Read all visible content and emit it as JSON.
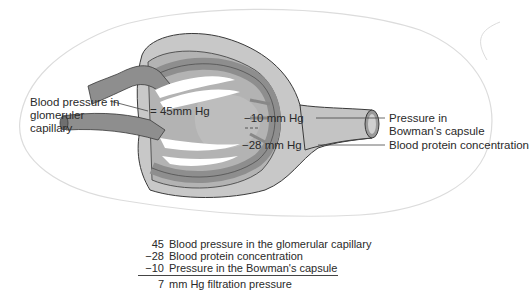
{
  "diagram": {
    "labels": {
      "glomerular_bp": [
        "Blood pressure in",
        "glomeruler",
        "capillary"
      ],
      "glomerular_value": "= 45mm Hg",
      "capsule_value": "−10 mm Hg",
      "capsule_label": [
        "Pressure in",
        "Bowman's capsule"
      ],
      "protein_value": "−28 mm Hg",
      "protein_label": "Blood protein concentration"
    },
    "summary": [
      {
        "value": "45",
        "text": "Blood pressure in the glomerular capillary"
      },
      {
        "value": "−28",
        "text": "Blood protein concentration"
      },
      {
        "value": "−10",
        "text": "Pressure in the Bowman's capsule"
      }
    ],
    "result": {
      "value": "7",
      "text": "mm Hg filtration pressure"
    },
    "colors": {
      "capsule": "#c8c8c8",
      "vessel": "#8e8e8e",
      "inner": "#bdbdbd",
      "outline": "#3a3a3a",
      "background_shape": "#d8d8d8"
    }
  }
}
